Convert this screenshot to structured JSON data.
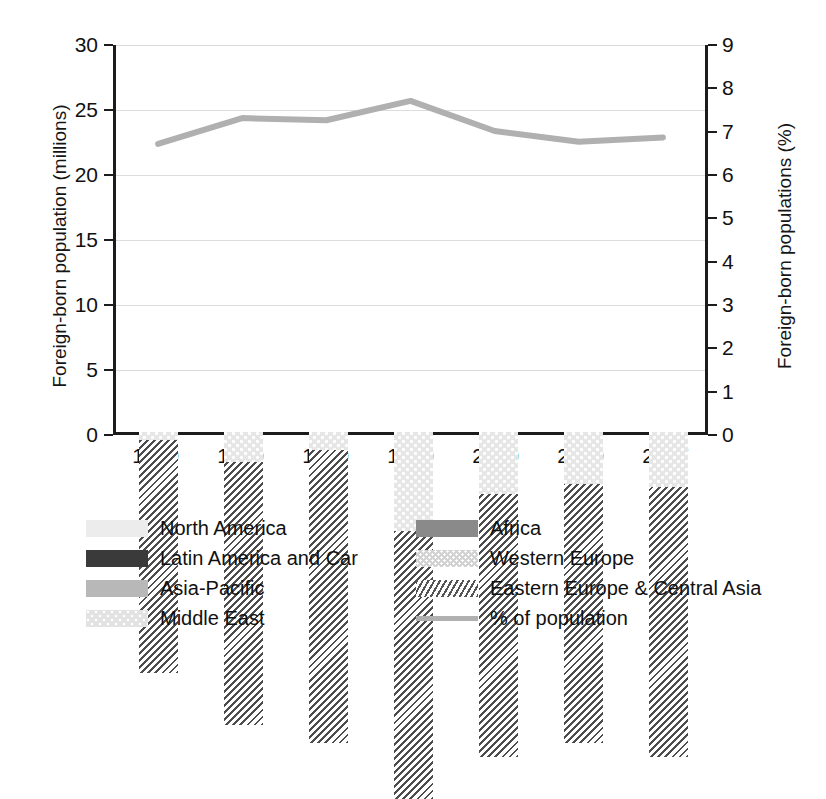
{
  "chart_data": {
    "type": "bar",
    "title": "",
    "xlabel": "Year",
    "ylabel": "Foreign-born population (millions)",
    "ylabel_right": "Foreign-born populations (%)",
    "categories": [
      "1960",
      "1970",
      "1980",
      "1990",
      "2000",
      "2010",
      "2017"
    ],
    "ylim": [
      0,
      30
    ],
    "ylim_right": [
      0,
      9
    ],
    "yticks": [
      "0",
      "5",
      "10",
      "15",
      "20",
      "25",
      "30"
    ],
    "yticks_right": [
      "0",
      "1",
      "2",
      "3",
      "4",
      "5",
      "6",
      "7",
      "8",
      "9"
    ],
    "grid": true,
    "legend_position": "bottom",
    "series": [
      {
        "name": "North America",
        "swatch": "sw-na",
        "values": [
          0,
          0,
          0,
          0,
          0,
          0,
          0
        ]
      },
      {
        "name": "Africa",
        "swatch": "sw-af",
        "values": [
          0,
          0,
          0,
          0,
          0,
          0,
          0
        ]
      },
      {
        "name": "Latin America and Car",
        "swatch": "sw-lac",
        "values": [
          0,
          0,
          0,
          0,
          0,
          0,
          0
        ]
      },
      {
        "name": "Western Europe",
        "swatch": "sw-we",
        "values": [
          0,
          0,
          0,
          0,
          0,
          0,
          0
        ]
      },
      {
        "name": "Asia-Pacific",
        "swatch": "sw-ap",
        "values": [
          0,
          0,
          0,
          0,
          0,
          0,
          0
        ]
      },
      {
        "name": "Eastern Europe & Central Asia",
        "swatch": "sw-eeca",
        "values": [
          17.9,
          20.2,
          22.5,
          20.6,
          20.2,
          19.9,
          20.8
        ]
      },
      {
        "name": "Middle East",
        "swatch": "sw-me",
        "values": [
          0.6,
          2.3,
          1.4,
          7.6,
          4.8,
          4.0,
          4.2
        ]
      }
    ],
    "line_series": {
      "name": "% of population",
      "swatch": "sw-line",
      "axis": "right",
      "values": [
        6.7,
        7.3,
        7.25,
        7.7,
        7.0,
        6.75,
        6.85
      ]
    },
    "bar_totals": [
      18.5,
      22.5,
      23.9,
      28.2,
      25.0,
      23.9,
      25.0
    ]
  },
  "legend": {
    "items": [
      {
        "label": "North America",
        "swatch": "sw-na"
      },
      {
        "label": "Africa",
        "swatch": "sw-af"
      },
      {
        "label": "Latin America and Car",
        "swatch": "sw-lac"
      },
      {
        "label": "Western Europe",
        "swatch": "sw-we"
      },
      {
        "label": "Asia-Pacific",
        "swatch": "sw-ap"
      },
      {
        "label": "Eastern Europe & Central Asia",
        "swatch": "sw-eeca"
      },
      {
        "label": "Middle East",
        "swatch": "sw-me"
      },
      {
        "label": "% of population",
        "swatch": "sw-line"
      }
    ]
  },
  "colors": {
    "line": "#b0b0b0",
    "axis": "#1c1c1c",
    "grid": "#dcdcdc",
    "hatch_dark": "#4d4d4d",
    "dot_light": "#e6e6e6"
  }
}
